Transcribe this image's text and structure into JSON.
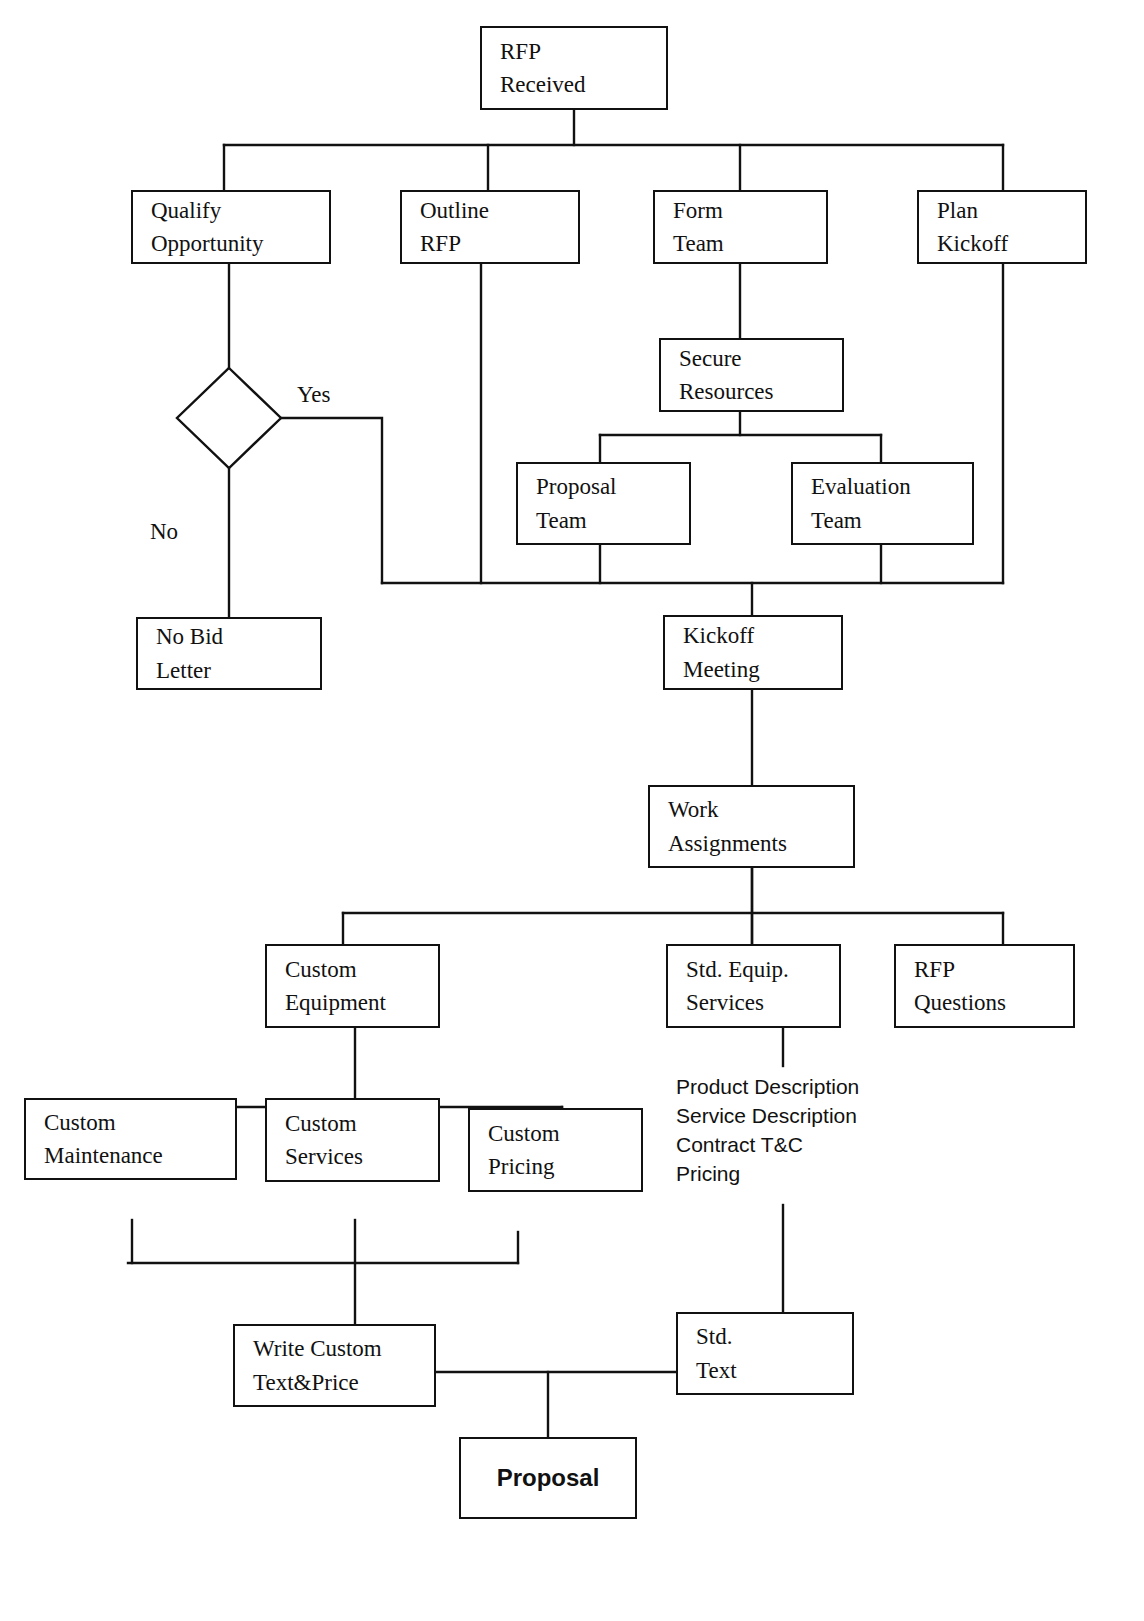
{
  "diagram": {
    "stroke_color": "#111111",
    "background_color": "#ffffff"
  },
  "nodes": {
    "rfp_received": {
      "line1": "RFP",
      "line2": "Received"
    },
    "qualify_opportunity": {
      "line1": "Qualify",
      "line2": "Opportunity"
    },
    "outline_rfp": {
      "line1": "Outline",
      "line2": "RFP"
    },
    "form_team": {
      "line1": "Form",
      "line2": "Team"
    },
    "plan_kickoff": {
      "line1": "Plan",
      "line2": "Kickoff"
    },
    "secure_resources": {
      "line1": "Secure",
      "line2": "Resources"
    },
    "proposal_team": {
      "line1": "Proposal",
      "line2": "Team"
    },
    "evaluation_team": {
      "line1": "Evaluation",
      "line2": "Team"
    },
    "no_bid_letter": {
      "line1": "No Bid",
      "line2": "Letter"
    },
    "kickoff_meeting": {
      "line1": "Kickoff",
      "line2": "Meeting"
    },
    "work_assignments": {
      "line1": "Work",
      "line2": "Assignments"
    },
    "custom_equipment": {
      "line1": "Custom",
      "line2": "Equipment"
    },
    "std_equip_services": {
      "line1": "Std. Equip.",
      "line2": "Services"
    },
    "rfp_questions": {
      "line1": "RFP",
      "line2": "Questions"
    },
    "custom_maintenance": {
      "line1": "Custom",
      "line2": "Maintenance"
    },
    "custom_services": {
      "line1": "Custom",
      "line2": "Services"
    },
    "custom_pricing": {
      "line1": "Custom",
      "line2": "Pricing"
    },
    "write_custom": {
      "line1": "Write Custom",
      "line2": "Text&Price"
    },
    "std_text": {
      "line1": "Std.",
      "line2": "Text"
    },
    "proposal": {
      "line1": "Proposal"
    }
  },
  "decision": {
    "name": "qualify-decision",
    "yes_label": "Yes",
    "no_label": "No"
  },
  "annotation_list": {
    "items": [
      "Product Description",
      "Service Description",
      "Contract T&C",
      "Pricing"
    ]
  }
}
